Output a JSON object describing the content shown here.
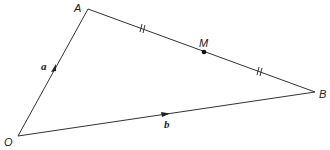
{
  "diagram": {
    "type": "vector-triangle",
    "points": {
      "O": {
        "label": "O",
        "x": 18,
        "y": 136
      },
      "A": {
        "label": "A",
        "x": 88,
        "y": 9
      },
      "B": {
        "label": "B",
        "x": 315,
        "y": 92
      },
      "M": {
        "label": "M",
        "x": 204,
        "y": 52
      }
    },
    "vectors": [
      {
        "from": "O",
        "to": "A",
        "label": "a"
      },
      {
        "from": "O",
        "to": "B",
        "label": "b"
      }
    ],
    "segments": [
      {
        "from": "A",
        "to": "B",
        "midpoint": "M",
        "equal_marks": "//"
      }
    ],
    "line_color": "#333333"
  }
}
